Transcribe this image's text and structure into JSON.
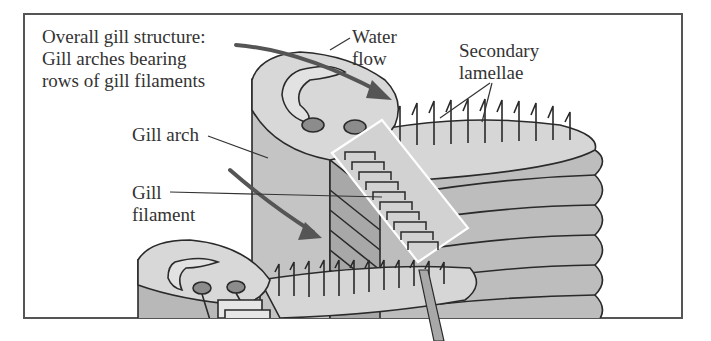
{
  "figure": {
    "title_lines": [
      "Overall gill structure:",
      "Gill arches bearing",
      "rows of gill filaments"
    ],
    "labels": {
      "water_flow": [
        "Water",
        "flow"
      ],
      "secondary_lamellae": [
        "Secondary",
        "lamellae"
      ],
      "gill_arch": "Gill arch",
      "gill_filament": [
        "Gill",
        "filament"
      ]
    },
    "colors": {
      "frame": "#555555",
      "text": "#333333",
      "arch_light": "#d6d6d6",
      "arch_mid": "#bdbdbd",
      "arch_dark": "#a8a8a8",
      "vessel": "#8c8c8c",
      "arrow": "#555555",
      "outline": "#2a2a2a"
    }
  }
}
